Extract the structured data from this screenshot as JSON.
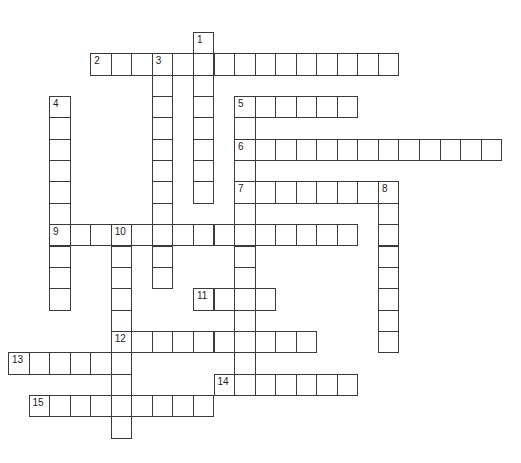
{
  "puzzle": {
    "type": "crossword",
    "grid": {
      "origin_x": 8,
      "origin_y": 32,
      "cell_width": 20.55,
      "cell_height": 21.35,
      "line_color": "#3a3a3a"
    },
    "entries": [
      {
        "number": "1",
        "direction": "down",
        "row": 0,
        "col": 9,
        "length": 8
      },
      {
        "number": "2",
        "direction": "across",
        "row": 1,
        "col": 4,
        "length": 15
      },
      {
        "number": "3",
        "direction": "down",
        "row": 1,
        "col": 7,
        "length": 11
      },
      {
        "number": "4",
        "direction": "down",
        "row": 3,
        "col": 2,
        "length": 10
      },
      {
        "number": "5",
        "direction": "across",
        "row": 3,
        "col": 11,
        "length": 6
      },
      {
        "number": "5",
        "direction": "down",
        "row": 3,
        "col": 11,
        "length": 14
      },
      {
        "number": "6",
        "direction": "across",
        "row": 5,
        "col": 11,
        "length": 13
      },
      {
        "number": "7",
        "direction": "across",
        "row": 7,
        "col": 11,
        "length": 8
      },
      {
        "number": "8",
        "direction": "down",
        "row": 7,
        "col": 18,
        "length": 8
      },
      {
        "number": "9",
        "direction": "across",
        "row": 9,
        "col": 2,
        "length": 15
      },
      {
        "number": "10",
        "direction": "down",
        "row": 9,
        "col": 5,
        "length": 10
      },
      {
        "number": "11",
        "direction": "across",
        "row": 12,
        "col": 9,
        "length": 4
      },
      {
        "number": "12",
        "direction": "across",
        "row": 14,
        "col": 5,
        "length": 10
      },
      {
        "number": "13",
        "direction": "across",
        "row": 15,
        "col": 0,
        "length": 6
      },
      {
        "number": "14",
        "direction": "across",
        "row": 16,
        "col": 10,
        "length": 7
      },
      {
        "number": "15",
        "direction": "across",
        "row": 17,
        "col": 1,
        "length": 9
      }
    ]
  }
}
